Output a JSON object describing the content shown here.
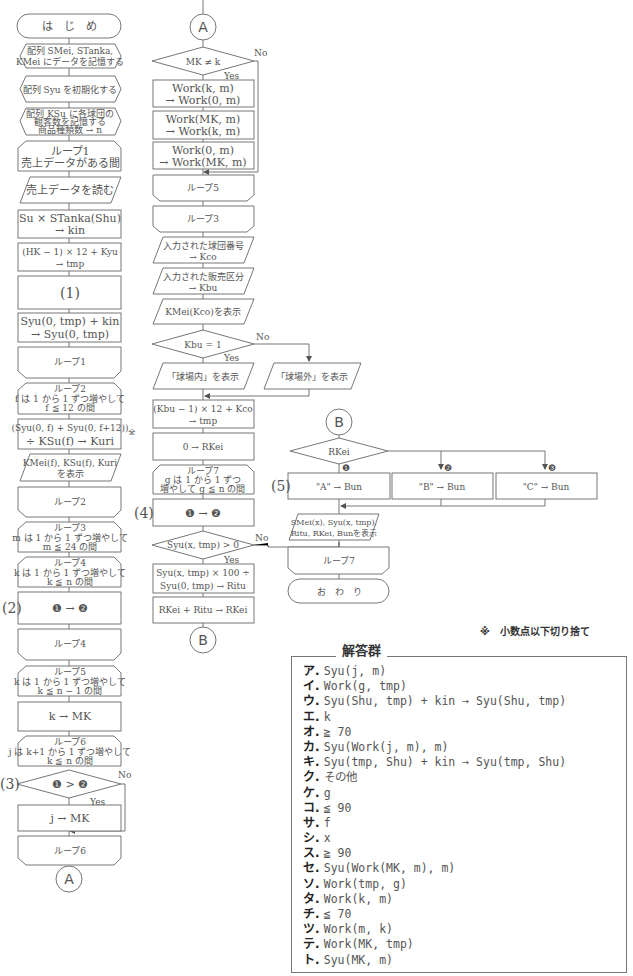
{
  "flowchart_left": {
    "start": "は　じ　め",
    "store_arrays": [
      "配列 SMei, STanka,",
      "KMei にデータを記憶する"
    ],
    "init_syu": "配列 Syu を初期化する",
    "store_ksu": [
      "配列 KSu に各球団の",
      "観客数を記憶する",
      "商品種類数 → n"
    ],
    "loop1_start": [
      "ループ1",
      "売上データがある間"
    ],
    "read_data": "売上データを読む",
    "calc_kin": [
      "Su × STanka(Shu)",
      "→ kin"
    ],
    "calc_tmp": [
      "(HK − 1) × 12 + Kyu",
      "→ tmp"
    ],
    "blank1": "(1)",
    "add_syu": [
      "Syu(0, tmp) + kin",
      "→ Syu(0, tmp)"
    ],
    "loop1_end": "ループ1",
    "loop2_start": [
      "ループ2",
      "f は 1 から 1 ずつ増やして",
      "f ≦ 12 の間"
    ],
    "calc_kuri": [
      "(Syu(0, f) + Syu(0, f+12))",
      "÷ KSu(f) → Kuri"
    ],
    "kuri_mark": "※",
    "display_kuri": [
      "KMei(f), KSu(f), Kuri",
      "を表示"
    ],
    "loop2_end": "ループ2",
    "loop3_start": [
      "ループ3",
      "m は 1 から 1 ずつ増やして",
      "m ≦ 24 の間"
    ],
    "loop4_start": [
      "ループ4",
      "k は 1 から 1 ずつ増やして",
      "k ≦ n の間"
    ],
    "blank2_label": "(2)",
    "blank2": "❶ → ❷",
    "loop4_end": "ループ4",
    "loop5_start": [
      "ループ5",
      "k は 1 から 1 ずつ増やして",
      "k ≦ n − 1 の間"
    ],
    "k_to_mk": "k → MK",
    "loop6_start": [
      "ループ6",
      "j は k+1 から 1 ずつ増やして",
      "k ≦ n の間"
    ],
    "blank3_label": "(3)",
    "blank3": "❶ > ❷",
    "yes": "Yes",
    "no": "No",
    "j_to_mk": "j → MK",
    "loop6_end": "ループ6",
    "connector_a": "A"
  },
  "flowchart_middle": {
    "connector_a": "A",
    "decision_mk": "MK ≠ k",
    "yes": "Yes",
    "no": "No",
    "swap1": [
      "Work(k, m)",
      "→ Work(0, m)"
    ],
    "swap2": [
      "Work(MK, m)",
      "→ Work(k, m)"
    ],
    "swap3": [
      "Work(0, m)",
      "→ Work(MK, m)"
    ],
    "loop5_end": "ループ5",
    "loop3_end": "ループ3",
    "input_kco": [
      "入力された球団番号",
      "→ Kco"
    ],
    "input_kbu": [
      "入力された販売区分",
      "→ Kbu"
    ],
    "display_kmei": "KMei(Kco)を表示",
    "decision_kbu": "Kbu = 1",
    "display_inside": "「球場内」を表示",
    "display_outside": "「球場外」を表示",
    "calc_tmp2": [
      "(Kbu − 1) × 12 + Kco",
      "→ tmp"
    ],
    "init_rkei": "0 → RKei",
    "loop7_start": [
      "ループ7",
      "g は 1 から 1 ずつ",
      "増やして g ≦ n の間"
    ],
    "blank4_label": "(4)",
    "blank4": "❶ → ❷",
    "decision_syu": "Syu(x, tmp) > 0",
    "calc_ritu": [
      "Syu(x, tmp) × 100 ÷",
      "Syu(0, tmp) → Ritu"
    ],
    "add_rkei": "RKei + Ritu → RKei",
    "connector_b": "B"
  },
  "flowchart_right": {
    "connector_b": "B",
    "decision_rkei": "RKei",
    "blank5_label": "(5)",
    "branch_marks": [
      "❶",
      "❷",
      "❸"
    ],
    "bun_a": "\"A\" → Bun",
    "bun_b": "\"B\" → Bun",
    "bun_c": "\"C\" → Bun",
    "display_result": [
      "SMei(x), Syu(x, tmp),",
      "Ritu, RKei, Bunを表示"
    ],
    "loop7_end": "ループ7",
    "end": "お　わ　り"
  },
  "footnote": "※　小数点以下切り捨て",
  "answer_group": {
    "title": "解答群",
    "items": [
      {
        "key": "ア",
        "value": "Syu(j, m)"
      },
      {
        "key": "イ",
        "value": "Work(g, tmp)"
      },
      {
        "key": "ウ",
        "value": "Syu(Shu, tmp) + kin →  Syu(Shu, tmp)"
      },
      {
        "key": "エ",
        "value": "k"
      },
      {
        "key": "オ",
        "value": "≧ 70"
      },
      {
        "key": "カ",
        "value": "Syu(Work(j, m), m)"
      },
      {
        "key": "キ",
        "value": "Syu(tmp, Shu) + kin →  Syu(tmp, Shu)"
      },
      {
        "key": "ク",
        "value": "その他"
      },
      {
        "key": "ケ",
        "value": "g"
      },
      {
        "key": "コ",
        "value": "≦ 90"
      },
      {
        "key": "サ",
        "value": "f"
      },
      {
        "key": "シ",
        "value": "x"
      },
      {
        "key": "ス",
        "value": "≧ 90"
      },
      {
        "key": "セ",
        "value": "Syu(Work(MK, m), m)"
      },
      {
        "key": "ソ",
        "value": "Work(tmp, g)"
      },
      {
        "key": "タ",
        "value": "Work(k, m)"
      },
      {
        "key": "チ",
        "value": "≦ 70"
      },
      {
        "key": "ツ",
        "value": "Work(m, k)"
      },
      {
        "key": "テ",
        "value": "Work(MK, tmp)"
      },
      {
        "key": "ト",
        "value": "Syu(MK, m)"
      }
    ]
  }
}
